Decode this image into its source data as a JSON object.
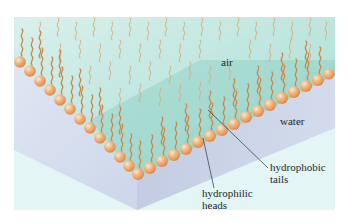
{
  "diagram": {
    "labels": {
      "air": "air",
      "water": "water",
      "tails_line1": "hydrophobic",
      "tails_line2": "tails",
      "heads_line1": "hydrophilic",
      "heads_line2": "heads"
    },
    "colors": {
      "background": "#ffffff",
      "panel": "#dff3f1",
      "air_region": "#bfe6e0",
      "air_region_dark": "#8fcfc4",
      "water_left_face": "#d6def0",
      "water_front_face": "#c8d0e4",
      "floor": "#e2f4f4",
      "head_ball": "#f0b07a",
      "head_highlight": "#fbe0c4",
      "tail": "#c88a4e",
      "leader_line": "#3a4a5a",
      "text": "#1f2a2e"
    },
    "components": [
      {
        "name": "air",
        "description": "upper region above monolayer"
      },
      {
        "name": "water",
        "description": "lower block below monolayer"
      },
      {
        "name": "hydrophilic heads",
        "description": "orange spheres at water surface"
      },
      {
        "name": "hydrophobic tails",
        "description": "wavy chains pointing into air"
      }
    ]
  }
}
